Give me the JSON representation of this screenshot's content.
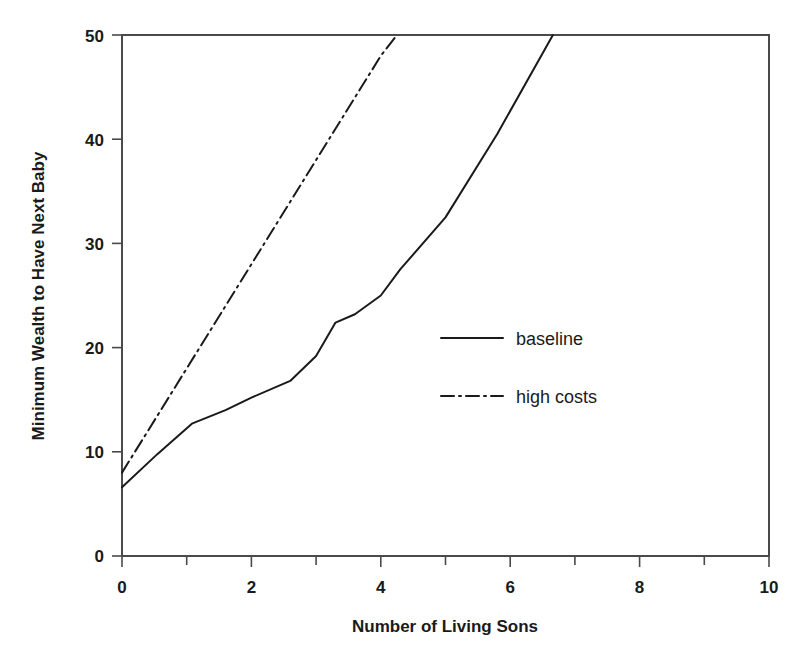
{
  "chart_data": {
    "type": "line",
    "title": "",
    "xlabel": "Number of Living Sons",
    "ylabel": "Minimum Wealth to Have Next Baby",
    "xlim": [
      0,
      10
    ],
    "ylim": [
      0,
      50
    ],
    "grid": false,
    "legend_position": "center-right",
    "x_ticks": [
      0,
      1,
      2,
      3,
      4,
      5,
      6,
      7,
      8,
      9,
      10
    ],
    "x_tick_labels": [
      "0",
      "",
      "2",
      "",
      "4",
      "",
      "6",
      "",
      "8",
      "",
      "10"
    ],
    "y_ticks": [
      0,
      10,
      20,
      30,
      40,
      50
    ],
    "y_tick_labels": [
      "0",
      "10",
      "20",
      "30",
      "40",
      "50"
    ],
    "series": [
      {
        "name": "baseline",
        "style": "solid",
        "color": "#1a1a1a",
        "x": [
          0,
          0.55,
          1.08,
          1.6,
          2.0,
          2.6,
          3.0,
          3.3,
          3.6,
          4.0,
          4.3,
          5.0,
          5.8,
          6.66
        ],
        "y": [
          6.6,
          9.8,
          12.7,
          14.0,
          15.2,
          16.8,
          19.2,
          22.4,
          23.2,
          25.0,
          27.5,
          32.5,
          40.5,
          50.0
        ]
      },
      {
        "name": "high costs",
        "style": "dashdot",
        "color": "#1a1a1a",
        "x": [
          0,
          1.0,
          2.0,
          3.0,
          4.0,
          4.25
        ],
        "y": [
          8.0,
          18.0,
          28.0,
          38.0,
          48.0,
          50.0
        ]
      }
    ],
    "legend_entries": [
      {
        "label": "baseline",
        "style": "solid"
      },
      {
        "label": "high costs",
        "style": "dashdot"
      }
    ]
  }
}
